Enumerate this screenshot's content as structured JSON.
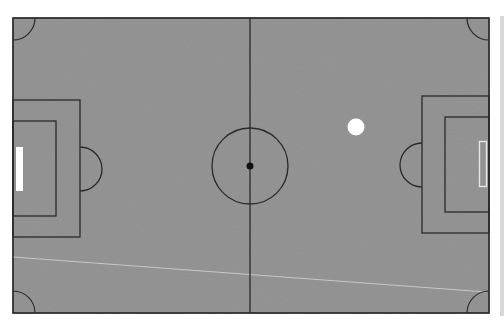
{
  "scene": {
    "type": "soccer-pitch-top-down",
    "colors": {
      "grass": "#8e8e8e",
      "lines": "#2a2a2a",
      "ball": "#ffffff",
      "goal_left_fill": "#ffffff",
      "goal_right_outline": "#e6e6e6",
      "trajectory_line": "#c8c8c8",
      "background": "#ffffff"
    },
    "field": {
      "x": 13,
      "y": 18,
      "width": 476,
      "height": 295
    },
    "center_line_x": 250,
    "center_circle": {
      "cx": 250,
      "cy": 166,
      "r": 38
    },
    "center_spot": {
      "cx": 250,
      "cy": 166,
      "r": 3.5
    },
    "left_penalty_box": {
      "x": 13,
      "y": 100,
      "width": 67,
      "height": 137
    },
    "left_goal_area": {
      "x": 13,
      "y": 121,
      "width": 43,
      "height": 95
    },
    "left_goal": {
      "x": 16,
      "y": 147,
      "width": 7,
      "height": 44
    },
    "right_penalty_box": {
      "x": 422,
      "y": 96,
      "width": 67,
      "height": 137
    },
    "right_goal_area": {
      "x": 445,
      "y": 117,
      "width": 44,
      "height": 95
    },
    "right_goal": {
      "x": 479,
      "y": 141,
      "width": 8,
      "height": 46
    },
    "ball": {
      "cx": 356,
      "cy": 127,
      "r": 8.5
    },
    "trajectory": {
      "x1": 13,
      "y1": 257,
      "x2": 486,
      "y2": 292
    }
  }
}
